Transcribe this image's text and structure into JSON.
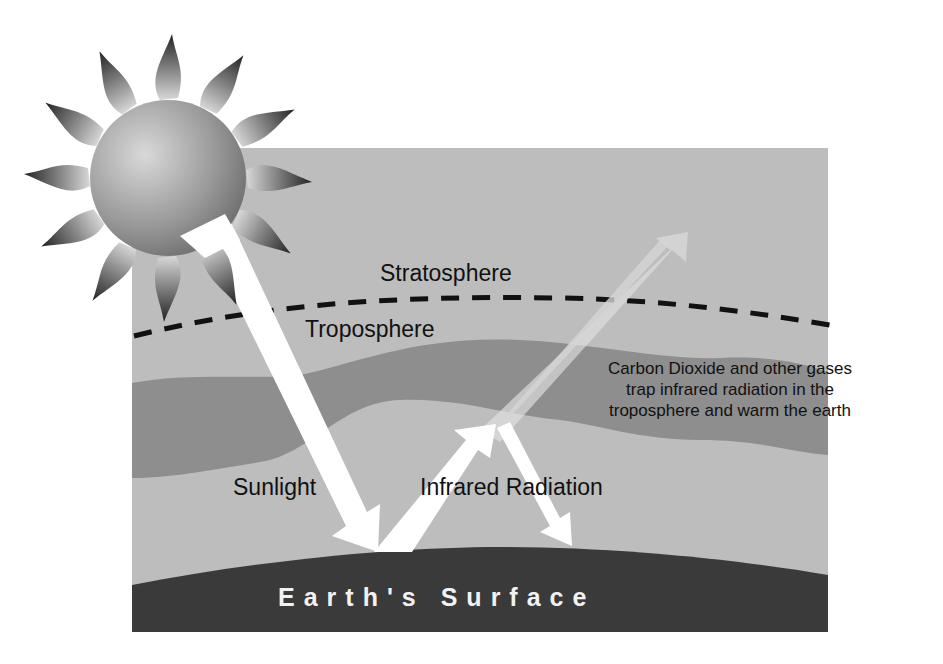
{
  "diagram": {
    "type": "greenhouse-effect",
    "labels": {
      "stratosphere": "Stratosphere",
      "troposphere": "Troposphere",
      "sunlight": "Sunlight",
      "infrared": "Infrared Radiation",
      "earth_surface": "Earth's Surface",
      "co2_note": [
        "Carbon Dioxide and other gases",
        "trap infrared radiation in the",
        "troposphere and warm the earth"
      ]
    },
    "colors": {
      "background": "#ffffff",
      "atmosphere": "#bdbdbd",
      "gas_band": "#8e8e8e",
      "earth": "#3a3a3a",
      "arrows": "#ffffff",
      "boundary_line": "#111111"
    },
    "elements": [
      {
        "id": "sun",
        "kind": "icon"
      },
      {
        "id": "stratosphere-boundary",
        "kind": "dashed-line"
      },
      {
        "id": "gas-band",
        "kind": "region"
      },
      {
        "id": "sunlight-arrow",
        "kind": "arrow",
        "direction": "down"
      },
      {
        "id": "infrared-arrow-up",
        "kind": "arrow",
        "direction": "up"
      },
      {
        "id": "infrared-arrow-escape",
        "kind": "arrow",
        "direction": "up-faded"
      },
      {
        "id": "infrared-arrow-back",
        "kind": "arrow",
        "direction": "down"
      },
      {
        "id": "earth-surface",
        "kind": "region"
      }
    ]
  }
}
